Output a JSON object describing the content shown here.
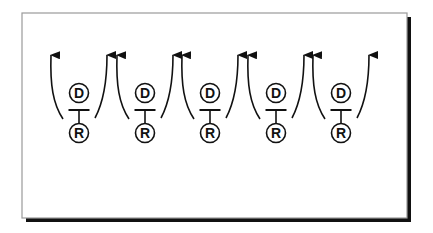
{
  "diagram": {
    "frame": {
      "x": 22,
      "y": 13,
      "width": 385,
      "height": 205,
      "border_color": "#9a9a9a",
      "shadow_color": "#111111",
      "shadow_offset": 4,
      "background": "#ffffff"
    },
    "style": {
      "stroke_color": "#111111",
      "stroke_width": 1.6,
      "circle_radius": 9.5,
      "bar_half_width": 10.5
    },
    "layout": {
      "d_center_y": 93,
      "bar_y": 110,
      "r_center_y": 133,
      "arrow_tip_y": 54,
      "arrow_base_y": 119,
      "arrow_tip_offset": 28,
      "arrow_base_offset": 14
    },
    "units": [
      {
        "id": "unit-1",
        "center_x": 79,
        "top_label": "D",
        "bottom_label": "R"
      },
      {
        "id": "unit-2",
        "center_x": 145,
        "top_label": "D",
        "bottom_label": "R"
      },
      {
        "id": "unit-3",
        "center_x": 210,
        "top_label": "D",
        "bottom_label": "R"
      },
      {
        "id": "unit-4",
        "center_x": 276,
        "top_label": "D",
        "bottom_label": "R"
      },
      {
        "id": "unit-5",
        "center_x": 341,
        "top_label": "D",
        "bottom_label": "R"
      }
    ]
  }
}
